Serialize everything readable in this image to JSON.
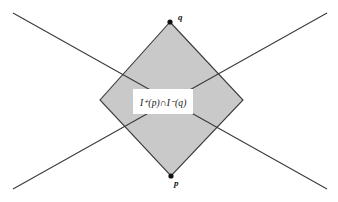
{
  "figure": {
    "background_color": "#ffffff",
    "region_fill_color": "#c9c9c9",
    "stroke_color": "#3a3a3a",
    "point_color": "#111111",
    "label_box_color": "#ffffff",
    "region_label": "I⁺(p)∩I⁻(q)",
    "points": [
      {
        "name": "q",
        "label": "q",
        "x": 170,
        "y": 22
      },
      {
        "name": "p",
        "label": "p",
        "x": 171,
        "y": 176
      }
    ],
    "diamond_vertices": "170,22 243,100 171,176 100,100",
    "light_rays": [
      {
        "name": "ray-upper-left-to-lower-right",
        "x1": 13,
        "y1": 13,
        "x2": 327,
        "y2": 189
      },
      {
        "name": "ray-upper-right-to-lower-left",
        "x1": 327,
        "y1": 13,
        "x2": 13,
        "y2": 189
      }
    ]
  },
  "chart_data": {
    "type": "diagram",
    "xlabel": "",
    "ylabel": "",
    "grid": false,
    "legend": "none",
    "xlim": [
      0,
      338
    ],
    "ylim": [
      202,
      0
    ],
    "annotations": [
      {
        "text": "q",
        "x": 170,
        "y": 22
      },
      {
        "text": "p",
        "x": 171,
        "y": 176
      },
      {
        "text": "I⁺(p)∩I⁻(q)",
        "x": 171,
        "y": 100
      }
    ],
    "shapes": [
      {
        "kind": "polygon",
        "name": "causal-diamond",
        "points": [
          [
            170,
            22
          ],
          [
            243,
            100
          ],
          [
            171,
            176
          ],
          [
            100,
            100
          ]
        ],
        "fill": "#c9c9c9",
        "stroke": "#3a3a3a"
      },
      {
        "kind": "line",
        "name": "light-ray-1",
        "points": [
          [
            13,
            13
          ],
          [
            327,
            189
          ]
        ],
        "stroke": "#3a3a3a"
      },
      {
        "kind": "line",
        "name": "light-ray-2",
        "points": [
          [
            327,
            13
          ],
          [
            13,
            189
          ]
        ],
        "stroke": "#3a3a3a"
      }
    ]
  }
}
